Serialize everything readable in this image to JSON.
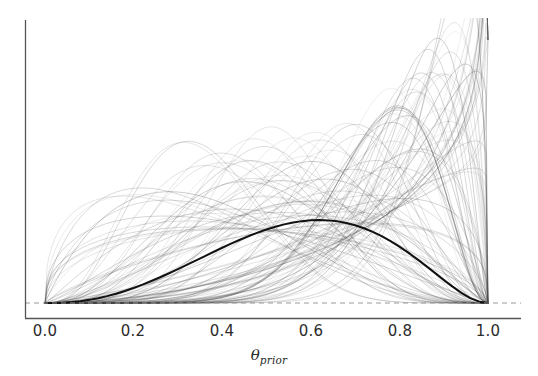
{
  "figure": {
    "background_color": "#ffffff",
    "width": 538,
    "height": 376
  },
  "axes": {
    "spine_color": "#555555",
    "left_spine_visible": true,
    "bottom_spine_visible": true,
    "top_spine_visible": false,
    "right_spine_visible": false,
    "xlabel_theta": "θ",
    "xlabel_sub": "prior",
    "ylabel": "",
    "y_tick_labels": [],
    "x_tick_labels": [
      "0.0",
      "0.2",
      "0.4",
      "0.6",
      "0.8",
      "1.0"
    ],
    "x_tick_values": [
      0.0,
      0.2,
      0.4,
      0.6,
      0.8,
      1.0
    ]
  },
  "chart_data": {
    "type": "line",
    "title": "",
    "subtitle": "",
    "xlabel": "θ_prior",
    "ylabel": "",
    "xlim": [
      0.0,
      1.0
    ],
    "ylim": [
      0.0,
      4.6
    ],
    "grid": false,
    "legend": null,
    "legend_position": "none",
    "annotations": [],
    "x": [
      0.0,
      0.02,
      0.04,
      0.06,
      0.08,
      0.1,
      0.12,
      0.14,
      0.16,
      0.18,
      0.2,
      0.22,
      0.24,
      0.26,
      0.28,
      0.3,
      0.32,
      0.34,
      0.36,
      0.38,
      0.4,
      0.42,
      0.44,
      0.46,
      0.48,
      0.5,
      0.52,
      0.54,
      0.56,
      0.58,
      0.6,
      0.62,
      0.64,
      0.66,
      0.68,
      0.7,
      0.72,
      0.74,
      0.76,
      0.78,
      0.8,
      0.82,
      0.84,
      0.86,
      0.88,
      0.9,
      0.92,
      0.94,
      0.96,
      0.98,
      1.0
    ],
    "series": [
      {
        "name": "mean prior density",
        "role": "mean",
        "color": "#111111",
        "linewidth": 2.0,
        "alpha": 1.0,
        "beta_a": 4.6,
        "beta_b": 3.6,
        "peak_x": 0.58,
        "peak_y": 2.35,
        "values": [
          0.0,
          0.0008,
          0.0053,
          0.0156,
          0.032,
          0.0549,
          0.0843,
          0.12,
          0.162,
          0.21,
          0.263,
          0.321,
          0.384,
          0.45,
          0.52,
          0.592,
          0.666,
          0.741,
          0.817,
          0.892,
          0.966,
          1.037,
          1.106,
          1.171,
          1.231,
          1.286,
          1.334,
          1.375,
          1.408,
          1.432,
          1.447,
          1.451,
          1.445,
          1.428,
          1.4,
          1.36,
          1.308,
          1.244,
          1.169,
          1.083,
          0.986,
          0.881,
          0.768,
          0.649,
          0.527,
          0.405,
          0.287,
          0.178,
          0.086,
          0.023,
          0.0
        ]
      },
      {
        "name": "prior draws",
        "role": "samples",
        "color": "#4a4a4a",
        "linewidth": 0.7,
        "alpha": 0.22,
        "n_curves": 110,
        "family": "beta",
        "beta_a_range": [
          0.9,
          9.5
        ],
        "beta_b_range": [
          0.9,
          9.5
        ],
        "peak_x_range": [
          0.18,
          1.0
        ],
        "max_y_observed": 4.6
      }
    ]
  },
  "baseline": {
    "name": "zero-reference-line",
    "y_value": 0.0,
    "color": "#9a9a9a",
    "style": "dashed",
    "linewidth": 1.0
  }
}
